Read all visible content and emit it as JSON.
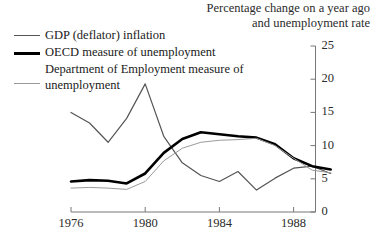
{
  "chart_data": {
    "type": "line",
    "title": "Percentage change on a year ago and unemployment rate",
    "title_lines": [
      "Percentage change on a year ago",
      "and unemployment rate"
    ],
    "xlabel": "",
    "ylabel": "",
    "xlim": [
      1976,
      1990.5
    ],
    "ylim": [
      0,
      25
    ],
    "yticks": [
      0,
      5,
      10,
      15,
      20,
      25
    ],
    "ytick_labels": [
      "0",
      "5",
      "10",
      "15",
      "20",
      "25"
    ],
    "xticks": [
      1976,
      1980,
      1984,
      1988
    ],
    "xtick_labels": [
      "1976",
      "1980",
      "1984",
      "1988"
    ],
    "grid": false,
    "legend_position": "top-left",
    "series": [
      {
        "name": "GDP (deflator) inflation",
        "style": "thin-gray",
        "color": "#555555",
        "width": 1.2,
        "x": [
          1976,
          1977,
          1978,
          1979,
          1980,
          1981,
          1982,
          1983,
          1984,
          1985,
          1986,
          1987,
          1988,
          1989,
          1990
        ],
        "values": [
          15.0,
          13.4,
          10.5,
          14.1,
          19.3,
          11.4,
          7.4,
          5.5,
          4.6,
          6.1,
          3.3,
          5.1,
          6.6,
          6.9,
          5.8
        ]
      },
      {
        "name": "OECD measure of unemployment",
        "style": "thick-black",
        "color": "#000000",
        "width": 2.6,
        "x": [
          1976,
          1977,
          1978,
          1979,
          1980,
          1981,
          1982,
          1983,
          1984,
          1985,
          1986,
          1987,
          1988,
          1989,
          1990
        ],
        "values": [
          4.6,
          4.8,
          4.7,
          4.3,
          5.8,
          8.9,
          11.0,
          12.0,
          11.7,
          11.4,
          11.2,
          10.2,
          8.1,
          6.9,
          6.4
        ]
      },
      {
        "name": "Department of Employment measure of unemployment",
        "style": "faint-gray",
        "color": "#9a9a9a",
        "width": 1.0,
        "x": [
          1976,
          1977,
          1978,
          1979,
          1980,
          1981,
          1982,
          1983,
          1984,
          1985,
          1986,
          1987,
          1988,
          1989,
          1990
        ],
        "values": [
          3.6,
          3.7,
          3.6,
          3.4,
          4.6,
          7.7,
          9.6,
          10.5,
          10.8,
          10.9,
          11.1,
          10.0,
          8.1,
          6.3,
          5.9
        ]
      }
    ]
  },
  "legend": {
    "items": [
      {
        "label": "GDP (deflator) inflation"
      },
      {
        "label": "OECD measure of unemployment"
      },
      {
        "label": "Department of Employment measure of unemployment"
      }
    ]
  }
}
